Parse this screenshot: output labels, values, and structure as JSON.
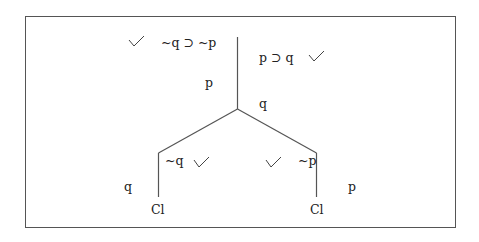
{
  "diagram": {
    "type": "truth-tree",
    "trunk": {
      "premises": [
        {
          "formula": "~q ⊃ ~p",
          "checked": true
        },
        {
          "formula": "p ⊃ q",
          "checked": true
        }
      ],
      "assumption_left": "p",
      "assumption_right": "q"
    },
    "branches": [
      {
        "side": "left",
        "node": "~q",
        "checked": true,
        "side_note": "q",
        "closure": "Cl"
      },
      {
        "side": "right",
        "node": "~p",
        "checked": true,
        "side_note": "p",
        "closure": "Cl"
      }
    ]
  }
}
